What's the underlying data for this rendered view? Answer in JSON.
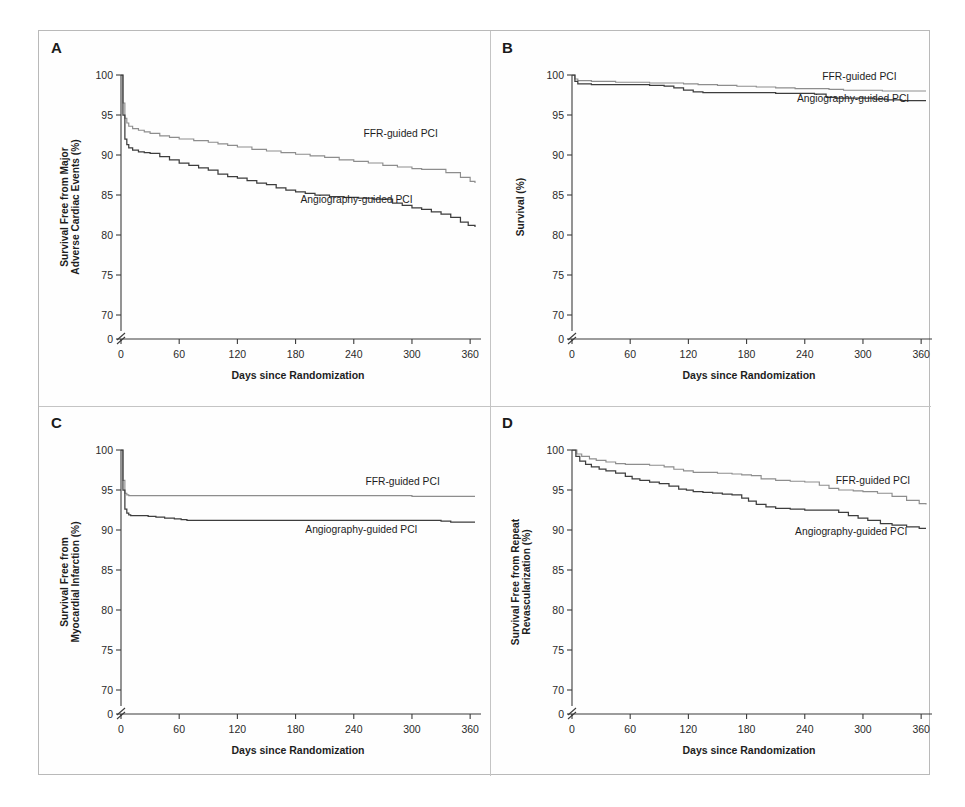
{
  "figure": {
    "panels": [
      "A",
      "B",
      "C",
      "D"
    ],
    "series_names": [
      "FFR-guided PCI",
      "Angiography-guided PCI"
    ],
    "colors": {
      "ffr": "#8d8d8d",
      "angiography": "#3d3d3d",
      "axis": "#3b3b3b",
      "border": "#b9b9b9"
    }
  },
  "chart_data": [
    {
      "panel": "A",
      "type": "line",
      "title": "",
      "xlabel": "Days since Randomization",
      "ylabel": "Survival Free from Major Adverse Cardiac Events (%)",
      "xlim": [
        0,
        365
      ],
      "ylim": [
        68,
        100
      ],
      "xticks": [
        0,
        60,
        120,
        180,
        240,
        300,
        360
      ],
      "yticks": [
        0,
        70,
        75,
        80,
        85,
        90,
        95,
        100
      ],
      "axis_break": true,
      "grid": false,
      "legend_position": "inline-right",
      "series": [
        {
          "name": "FFR-guided PCI",
          "label_x": 250,
          "label_y": 92.3,
          "x": [
            0,
            2,
            4,
            6,
            8,
            12,
            18,
            24,
            30,
            40,
            50,
            60,
            75,
            90,
            100,
            110,
            120,
            135,
            150,
            165,
            180,
            195,
            210,
            225,
            240,
            255,
            270,
            285,
            300,
            310,
            320,
            335,
            350,
            360,
            365
          ],
          "values": [
            100,
            96.5,
            94.6,
            94.0,
            93.6,
            93.3,
            93.1,
            92.9,
            92.7,
            92.4,
            92.2,
            92.0,
            91.8,
            91.6,
            91.4,
            91.2,
            91.0,
            90.7,
            90.5,
            90.3,
            90.1,
            89.9,
            89.7,
            89.4,
            89.2,
            89.0,
            88.7,
            88.5,
            88.3,
            88.2,
            88.2,
            87.8,
            87.2,
            86.7,
            86.5
          ]
        },
        {
          "name": "Angiography-guided PCI",
          "label_x": 185,
          "label_y": 84.0,
          "x": [
            0,
            2,
            4,
            6,
            8,
            12,
            18,
            24,
            30,
            40,
            50,
            60,
            70,
            80,
            90,
            100,
            110,
            120,
            130,
            140,
            150,
            160,
            170,
            180,
            190,
            200,
            215,
            230,
            245,
            260,
            270,
            280,
            290,
            300,
            310,
            320,
            330,
            340,
            350,
            358,
            365
          ],
          "values": [
            100,
            95.0,
            92.0,
            91.3,
            90.9,
            90.6,
            90.4,
            90.3,
            90.2,
            89.8,
            89.4,
            89.0,
            88.7,
            88.4,
            88.1,
            87.6,
            87.3,
            87.1,
            86.8,
            86.5,
            86.3,
            85.9,
            85.6,
            85.4,
            85.2,
            85.0,
            84.8,
            84.7,
            84.6,
            84.5,
            84.5,
            84.0,
            83.7,
            83.4,
            83.2,
            82.9,
            82.6,
            82.2,
            81.6,
            81.2,
            81.0
          ]
        }
      ]
    },
    {
      "panel": "B",
      "type": "line",
      "title": "",
      "xlabel": "Days since Randomization",
      "ylabel": "Survival (%)",
      "xlim": [
        0,
        365
      ],
      "ylim": [
        68,
        100
      ],
      "xticks": [
        0,
        60,
        120,
        180,
        240,
        300,
        360
      ],
      "yticks": [
        0,
        70,
        75,
        80,
        85,
        90,
        95,
        100
      ],
      "axis_break": true,
      "grid": false,
      "legend_position": "inline-right",
      "series": [
        {
          "name": "FFR-guided PCI",
          "label_x": 258,
          "label_y": 99.4,
          "x": [
            0,
            3,
            6,
            12,
            20,
            30,
            45,
            60,
            80,
            100,
            115,
            130,
            150,
            170,
            190,
            210,
            230,
            250,
            265,
            280,
            300,
            320,
            340,
            360,
            365
          ],
          "values": [
            100,
            99.5,
            99.3,
            99.3,
            99.2,
            99.2,
            99.1,
            99.1,
            99.0,
            99.0,
            98.9,
            98.8,
            98.7,
            98.6,
            98.5,
            98.4,
            98.3,
            98.3,
            98.2,
            98.1,
            98.1,
            98.0,
            98.0,
            98.0,
            98.0
          ]
        },
        {
          "name": "Angiography-guided PCI",
          "label_x": 232,
          "label_y": 96.6,
          "x": [
            0,
            3,
            6,
            12,
            20,
            30,
            45,
            60,
            80,
            95,
            105,
            115,
            125,
            135,
            150,
            170,
            190,
            210,
            230,
            250,
            262,
            272,
            285,
            300,
            312,
            325,
            340,
            355,
            365
          ],
          "values": [
            100,
            99.2,
            98.9,
            98.9,
            98.8,
            98.8,
            98.8,
            98.8,
            98.7,
            98.6,
            98.4,
            98.1,
            97.9,
            97.8,
            97.8,
            97.8,
            97.8,
            97.7,
            97.7,
            97.6,
            97.2,
            97.1,
            97.1,
            97.1,
            97.0,
            96.9,
            96.8,
            96.8,
            96.8
          ]
        }
      ]
    },
    {
      "panel": "C",
      "type": "line",
      "title": "",
      "xlabel": "Days since Randomization",
      "ylabel": "Survival Free from Myocardial Infarction (%)",
      "xlim": [
        0,
        365
      ],
      "ylim": [
        68,
        100
      ],
      "xticks": [
        0,
        60,
        120,
        180,
        240,
        300,
        360
      ],
      "yticks": [
        0,
        70,
        75,
        80,
        85,
        90,
        95,
        100
      ],
      "axis_break": true,
      "grid": false,
      "legend_position": "inline-right",
      "series": [
        {
          "name": "FFR-guided PCI",
          "label_x": 252,
          "label_y": 95.6,
          "x": [
            0,
            2,
            4,
            6,
            8,
            12,
            18,
            25,
            40,
            60,
            90,
            120,
            180,
            240,
            300,
            340,
            365
          ],
          "values": [
            100,
            96.2,
            94.6,
            94.4,
            94.3,
            94.3,
            94.3,
            94.3,
            94.3,
            94.3,
            94.3,
            94.3,
            94.3,
            94.3,
            94.2,
            94.2,
            94.2
          ]
        },
        {
          "name": "Angiography-guided PCI",
          "label_x": 190,
          "label_y": 89.6,
          "x": [
            0,
            2,
            4,
            6,
            8,
            10,
            14,
            20,
            28,
            36,
            45,
            55,
            62,
            68,
            75,
            90,
            120,
            180,
            240,
            300,
            330,
            340,
            355,
            365
          ],
          "values": [
            100,
            95.0,
            92.6,
            92.1,
            91.9,
            91.8,
            91.8,
            91.8,
            91.7,
            91.6,
            91.5,
            91.4,
            91.3,
            91.2,
            91.2,
            91.2,
            91.2,
            91.2,
            91.2,
            91.2,
            91.1,
            91.0,
            91.0,
            91.0
          ]
        }
      ]
    },
    {
      "panel": "D",
      "type": "line",
      "title": "",
      "xlabel": "Days since Randomization",
      "ylabel": "Survival Free from Repeat Revascularization (%)",
      "xlim": [
        0,
        365
      ],
      "ylim": [
        68,
        100
      ],
      "xticks": [
        0,
        60,
        120,
        180,
        240,
        300,
        360
      ],
      "yticks": [
        0,
        70,
        75,
        80,
        85,
        90,
        95,
        100
      ],
      "axis_break": true,
      "grid": false,
      "legend_position": "inline-right",
      "series": [
        {
          "name": "FFR-guided PCI",
          "label_x": 272,
          "label_y": 95.8,
          "x": [
            0,
            5,
            10,
            18,
            25,
            35,
            45,
            55,
            65,
            80,
            95,
            105,
            115,
            125,
            135,
            150,
            165,
            175,
            185,
            195,
            210,
            225,
            240,
            255,
            265,
            275,
            290,
            300,
            315,
            330,
            345,
            358,
            365
          ],
          "values": [
            100,
            99.5,
            99.2,
            98.9,
            98.7,
            98.5,
            98.3,
            98.2,
            98.2,
            98.1,
            97.9,
            97.6,
            97.4,
            97.2,
            97.2,
            97.1,
            97.0,
            96.9,
            96.8,
            96.4,
            96.2,
            96.1,
            96.0,
            95.6,
            95.2,
            95.0,
            94.9,
            94.8,
            94.6,
            94.2,
            93.7,
            93.3,
            93.2
          ]
        },
        {
          "name": "Angiography-guided PCI",
          "label_x": 230,
          "label_y": 89.4,
          "x": [
            0,
            4,
            8,
            14,
            20,
            28,
            35,
            45,
            55,
            62,
            70,
            80,
            90,
            100,
            110,
            118,
            125,
            135,
            145,
            155,
            165,
            175,
            182,
            190,
            200,
            210,
            225,
            240,
            255,
            268,
            275,
            285,
            295,
            305,
            318,
            330,
            345,
            358,
            365
          ],
          "values": [
            100,
            99.2,
            98.6,
            98.2,
            97.9,
            97.6,
            97.4,
            97.1,
            96.7,
            96.4,
            96.2,
            96.0,
            95.8,
            95.5,
            95.1,
            95.0,
            94.8,
            94.7,
            94.6,
            94.5,
            94.4,
            94.0,
            93.6,
            93.2,
            92.9,
            92.7,
            92.6,
            92.5,
            92.5,
            92.5,
            92.2,
            91.8,
            91.5,
            91.2,
            90.8,
            90.6,
            90.4,
            90.2,
            90.2
          ]
        }
      ]
    }
  ]
}
